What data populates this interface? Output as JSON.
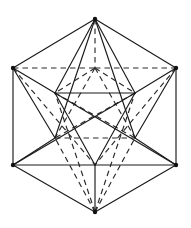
{
  "figure": {
    "type": "polyhedron-net-projection",
    "canvas": {
      "width": 191,
      "height": 228
    },
    "background_color": "#ffffff",
    "line_color": "#1a1a1a",
    "hidden_line_color": "#2b2b2b",
    "hidden_line_style": "dashed",
    "visible_line_style": "solid",
    "stroke_width": 1.15,
    "dash_pattern": "5.5 4",
    "vertex_count": 12,
    "vertex_marker_radius": 2.2
  },
  "vertices": [
    {
      "id": "top",
      "label": "T",
      "x": 95,
      "y": 19,
      "marker": true
    },
    {
      "id": "upper-left",
      "label": "UL",
      "x": 13,
      "y": 68,
      "marker": true
    },
    {
      "id": "upper-right",
      "label": "UR",
      "x": 176,
      "y": 68,
      "marker": true
    },
    {
      "id": "lower-left",
      "label": "LL",
      "x": 13,
      "y": 165,
      "marker": true
    },
    {
      "id": "lower-right",
      "label": "LR",
      "x": 176,
      "y": 165,
      "marker": true
    },
    {
      "id": "bottom",
      "label": "B",
      "x": 95,
      "y": 212,
      "marker": true
    },
    {
      "id": "inner-top",
      "label": "it",
      "x": 95,
      "y": 68,
      "marker": false
    },
    {
      "id": "inner-ul",
      "label": "iu",
      "x": 55,
      "y": 93,
      "marker": false
    },
    {
      "id": "inner-ur",
      "label": "ir",
      "x": 135,
      "y": 93,
      "marker": false
    },
    {
      "id": "inner-ll",
      "label": "il",
      "x": 55,
      "y": 138,
      "marker": false
    },
    {
      "id": "inner-lr",
      "label": "ig",
      "x": 135,
      "y": 138,
      "marker": false
    },
    {
      "id": "inner-bottom",
      "label": "ib",
      "x": 95,
      "y": 165,
      "marker": false
    }
  ],
  "edges_solid": [
    {
      "from": "upper-left",
      "to": "top",
      "x1": 13,
      "y1": 68,
      "x2": 95,
      "y2": 19
    },
    {
      "from": "top",
      "to": "upper-right",
      "x1": 95,
      "y1": 19,
      "x2": 176,
      "y2": 68
    },
    {
      "from": "upper-left",
      "to": "lower-left",
      "x1": 13,
      "y1": 68,
      "x2": 13,
      "y2": 165
    },
    {
      "from": "upper-right",
      "to": "lower-right",
      "x1": 176,
      "y1": 68,
      "x2": 176,
      "y2": 165
    },
    {
      "from": "lower-left",
      "to": "bottom",
      "x1": 13,
      "y1": 165,
      "x2": 95,
      "y2": 212
    },
    {
      "from": "bottom",
      "to": "lower-right",
      "x1": 95,
      "y1": 212,
      "x2": 176,
      "y2": 165
    },
    {
      "from": "top",
      "to": "inner-ul",
      "x1": 95,
      "y1": 19,
      "x2": 55,
      "y2": 93
    },
    {
      "from": "top",
      "to": "inner-ur",
      "x1": 95,
      "y1": 19,
      "x2": 135,
      "y2": 93
    },
    {
      "from": "top",
      "to": "inner-ll",
      "x1": 95,
      "y1": 19,
      "x2": 55,
      "y2": 138
    },
    {
      "from": "top",
      "to": "inner-lr",
      "x1": 95,
      "y1": 19,
      "x2": 135,
      "y2": 138
    },
    {
      "from": "upper-left",
      "to": "inner-ul",
      "x1": 13,
      "y1": 68,
      "x2": 55,
      "y2": 93
    },
    {
      "from": "upper-right",
      "to": "inner-ur",
      "x1": 176,
      "y1": 68,
      "x2": 135,
      "y2": 93
    },
    {
      "from": "upper-left",
      "to": "inner-ll",
      "x1": 13,
      "y1": 68,
      "x2": 55,
      "y2": 138
    },
    {
      "from": "upper-right",
      "to": "inner-lr",
      "x1": 176,
      "y1": 68,
      "x2": 135,
      "y2": 138
    },
    {
      "from": "inner-ul",
      "to": "inner-ur",
      "x1": 55,
      "y1": 93,
      "x2": 135,
      "y2": 93
    },
    {
      "from": "inner-ul",
      "to": "inner-bottom",
      "x1": 55,
      "y1": 93,
      "x2": 95,
      "y2": 165
    },
    {
      "from": "inner-ur",
      "to": "inner-bottom",
      "x1": 135,
      "y1": 93,
      "x2": 95,
      "y2": 165
    },
    {
      "from": "lower-left",
      "to": "inner-ll",
      "x1": 13,
      "y1": 165,
      "x2": 55,
      "y2": 138
    },
    {
      "from": "lower-right",
      "to": "inner-lr",
      "x1": 176,
      "y1": 165,
      "x2": 135,
      "y2": 138
    },
    {
      "from": "lower-left",
      "to": "inner-bottom",
      "x1": 13,
      "y1": 165,
      "x2": 95,
      "y2": 165
    },
    {
      "from": "lower-right",
      "to": "inner-bottom",
      "x1": 176,
      "y1": 165,
      "x2": 95,
      "y2": 165
    },
    {
      "from": "lower-left",
      "to": "inner-ur",
      "x1": 13,
      "y1": 165,
      "x2": 135,
      "y2": 93
    },
    {
      "from": "lower-right",
      "to": "inner-ul",
      "x1": 176,
      "y1": 165,
      "x2": 55,
      "y2": 93
    },
    {
      "from": "inner-bottom",
      "to": "bottom",
      "x1": 95,
      "y1": 165,
      "x2": 95,
      "y2": 212
    }
  ],
  "edges_dashed": [
    {
      "from": "upper-left",
      "to": "inner-top",
      "x1": 13,
      "y1": 68,
      "x2": 95,
      "y2": 68
    },
    {
      "from": "inner-top",
      "to": "upper-right",
      "x1": 95,
      "y1": 68,
      "x2": 176,
      "y2": 68
    },
    {
      "from": "top",
      "to": "inner-top",
      "x1": 95,
      "y1": 19,
      "x2": 95,
      "y2": 68
    },
    {
      "from": "inner-top",
      "to": "inner-ll",
      "x1": 95,
      "y1": 68,
      "x2": 55,
      "y2": 138
    },
    {
      "from": "inner-top",
      "to": "inner-lr",
      "x1": 95,
      "y1": 68,
      "x2": 135,
      "y2": 138
    },
    {
      "from": "inner-ll",
      "to": "inner-lr",
      "x1": 55,
      "y1": 138,
      "x2": 135,
      "y2": 138
    },
    {
      "from": "inner-ul",
      "to": "inner-lr",
      "x1": 55,
      "y1": 93,
      "x2": 135,
      "y2": 138
    },
    {
      "from": "inner-ur",
      "to": "inner-ll",
      "x1": 135,
      "y1": 93,
      "x2": 55,
      "y2": 138
    },
    {
      "from": "inner-top",
      "to": "inner-ul",
      "x1": 95,
      "y1": 68,
      "x2": 55,
      "y2": 93
    },
    {
      "from": "inner-top",
      "to": "inner-ur",
      "x1": 95,
      "y1": 68,
      "x2": 135,
      "y2": 93
    },
    {
      "from": "upper-left",
      "to": "inner-bottom",
      "x1": 13,
      "y1": 68,
      "x2": 95,
      "y2": 165
    },
    {
      "from": "upper-right",
      "to": "inner-bottom",
      "x1": 176,
      "y1": 68,
      "x2": 95,
      "y2": 165
    },
    {
      "from": "bottom",
      "to": "inner-ll",
      "x1": 95,
      "y1": 212,
      "x2": 55,
      "y2": 138
    },
    {
      "from": "bottom",
      "to": "inner-lr",
      "x1": 95,
      "y1": 212,
      "x2": 135,
      "y2": 138
    },
    {
      "from": "bottom",
      "to": "inner-ul",
      "x1": 95,
      "y1": 212,
      "x2": 55,
      "y2": 93
    },
    {
      "from": "bottom",
      "to": "inner-ur",
      "x1": 95,
      "y1": 212,
      "x2": 135,
      "y2": 93
    }
  ]
}
